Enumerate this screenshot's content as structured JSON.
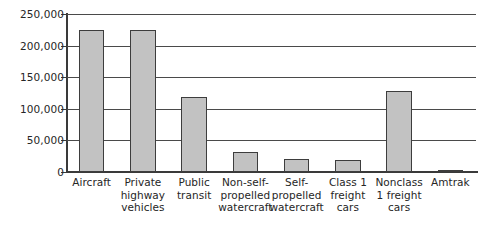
{
  "chart_data": {
    "type": "bar",
    "title": "",
    "xlabel": "",
    "ylabel": "",
    "ylim": [
      0,
      250000
    ],
    "grid": true,
    "legend": "none",
    "yticks": [
      0,
      50000,
      100000,
      150000,
      200000,
      250000
    ],
    "ytick_labels": [
      "0",
      "50,000",
      "100,000",
      "150,000",
      "200,000",
      "250,000"
    ],
    "categories": [
      "Aircraft",
      "Private highway vehicles",
      "Public transit",
      "Non-self-propelled watercraft",
      "Self-propelled watercraft",
      "Class 1 freight cars",
      "Nonclass 1 freight cars",
      "Amtrak"
    ],
    "category_lines": [
      [
        "Aircraft"
      ],
      [
        "Private",
        "highway",
        "vehicles"
      ],
      [
        "Public",
        "transit"
      ],
      [
        "Non-self-",
        "propelled",
        "watercraft"
      ],
      [
        "Self-",
        "propelled",
        "watercraft"
      ],
      [
        "Class 1",
        "freight",
        "cars"
      ],
      [
        "Nonclass",
        "1 freight",
        "cars"
      ],
      [
        "Amtrak"
      ]
    ],
    "values": [
      225000,
      225000,
      118000,
      32000,
      20000,
      19000,
      128000,
      3500
    ],
    "bar_color": "#c2c2c2",
    "bar_edge_color": "#3d3d3d",
    "axis_color": "#3a3a3a",
    "grid_color": "#4a4a4a"
  }
}
